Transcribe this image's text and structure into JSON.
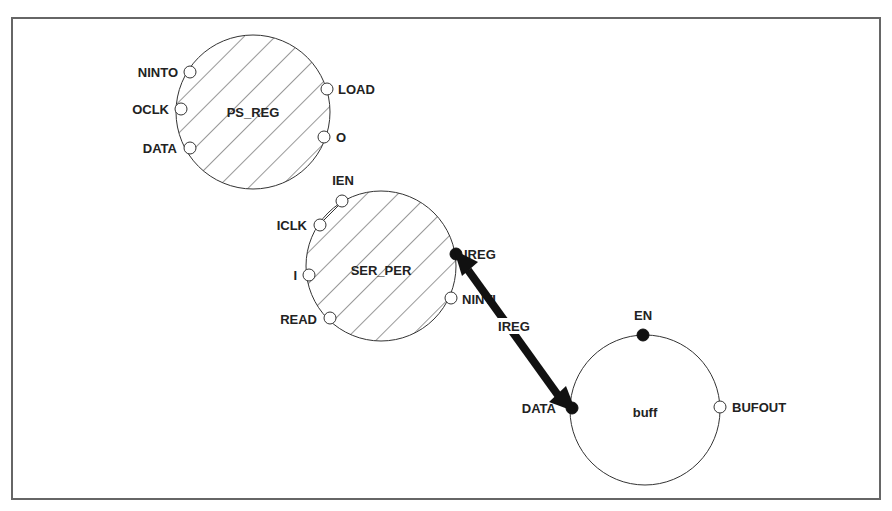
{
  "diagram": {
    "type": "block-diagram",
    "nodes": [
      {
        "id": "ps_reg",
        "title": "PS_REG",
        "hatched": true,
        "ports": [
          {
            "name": "NINTO",
            "side": "left",
            "filled": false
          },
          {
            "name": "OCLK",
            "side": "left",
            "filled": false
          },
          {
            "name": "DATA",
            "side": "left",
            "filled": false
          },
          {
            "name": "LOAD",
            "side": "right",
            "filled": false
          },
          {
            "name": "O",
            "side": "right",
            "filled": false
          }
        ]
      },
      {
        "id": "ser_per",
        "title": "SER_PER",
        "hatched": true,
        "ports": [
          {
            "name": "IEN",
            "side": "top-left",
            "filled": false
          },
          {
            "name": "ICLK",
            "side": "left",
            "filled": false
          },
          {
            "name": "I",
            "side": "left",
            "filled": false
          },
          {
            "name": "READ",
            "side": "left",
            "filled": false
          },
          {
            "name": "IREG",
            "side": "right",
            "filled": true
          },
          {
            "name": "NINTI",
            "side": "right",
            "filled": false
          }
        ]
      },
      {
        "id": "buff",
        "title": "buff",
        "hatched": false,
        "ports": [
          {
            "name": "EN",
            "side": "top",
            "filled": true
          },
          {
            "name": "DATA",
            "side": "left",
            "filled": true
          },
          {
            "name": "BUFOUT",
            "side": "right",
            "filled": false
          }
        ]
      }
    ],
    "edges": [
      {
        "from": "ser_per.IREG",
        "to": "buff.DATA",
        "label": "IREG",
        "bidirectional": true
      }
    ],
    "colors": {
      "stroke": "#222222",
      "arrow": "#111111",
      "frame": "#666666",
      "background": "#ffffff"
    }
  }
}
